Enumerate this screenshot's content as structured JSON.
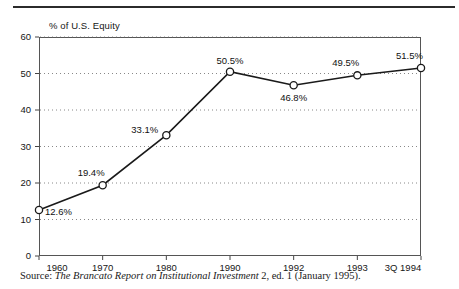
{
  "figure": {
    "axis_title": "% of U.S. Equity",
    "source_prefix": "Source:",
    "source_title": "The Brancato Report on Institutional Investment",
    "source_rest": "2, ed. 1 (January 1995)."
  },
  "chart_data": {
    "type": "line",
    "title": "",
    "subtitle": "",
    "xlabel": "",
    "ylabel": "% of U.S. Equity",
    "categories": [
      "1960",
      "1970",
      "1980",
      "1990",
      "1992",
      "1993",
      "3Q 1994"
    ],
    "values": [
      12.6,
      19.4,
      33.1,
      50.5,
      46.8,
      49.5,
      51.5
    ],
    "point_labels": [
      "12.6%",
      "19.4%",
      "33.1%",
      "50.5%",
      "46.8%",
      "49.5%",
      "51.5%"
    ],
    "label_positions": [
      "right",
      "above-left",
      "left",
      "above",
      "below",
      "above-left",
      "above-left"
    ],
    "ylim": [
      0,
      60
    ],
    "yticks": [
      0,
      10,
      20,
      30,
      40,
      50,
      60
    ],
    "ytick_labels": [
      "0",
      "10",
      "20",
      "30",
      "40",
      "50",
      "60"
    ],
    "xtick_labels": [
      "1960",
      "1970",
      "1980",
      "1990",
      "1992",
      "1993",
      "3Q 1994"
    ],
    "grid": "horizontal-dotted",
    "legend": "none",
    "series": [
      {
        "name": "% of U.S. Equity held by institutions",
        "values": [
          12.6,
          19.4,
          33.1,
          50.5,
          46.8,
          49.5,
          51.5
        ]
      }
    ],
    "marker": "open-circle",
    "line_color": "#1a1a1a",
    "marker_fill": "#ffffff"
  }
}
